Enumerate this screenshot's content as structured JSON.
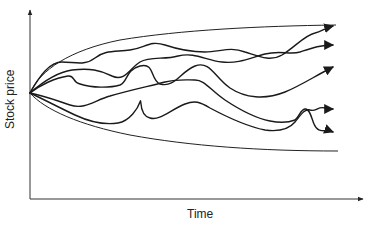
{
  "chart_data": {
    "type": "line",
    "title": "",
    "xlabel": "Time",
    "ylabel": "Stock price",
    "grid": false,
    "legend": null,
    "origin": {
      "x": 0,
      "y": 0
    },
    "envelope": {
      "upper": {
        "name": "upper bound",
        "trend": "rising, concave"
      },
      "lower": {
        "name": "lower bound",
        "trend": "falling, convex"
      }
    },
    "series": [
      {
        "name": "path 1",
        "end": "highest, arrow near upper bound"
      },
      {
        "name": "path 2",
        "end": "high"
      },
      {
        "name": "path 3",
        "end": "upper-middle"
      },
      {
        "name": "path 4",
        "end": "lower-middle"
      },
      {
        "name": "path 5",
        "end": "lowest"
      }
    ],
    "num_paths": 5
  },
  "labels": {
    "x_axis": "Time",
    "y_axis": "Stock price"
  }
}
